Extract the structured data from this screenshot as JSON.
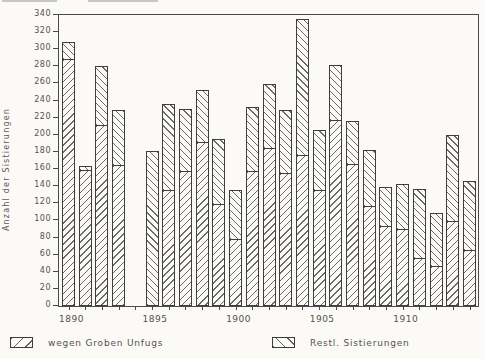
{
  "chart_data": {
    "type": "bar",
    "stacked": true,
    "title": "",
    "xlabel": "",
    "ylabel": "Anzahl der Sistierungen",
    "ylim": [
      0,
      340
    ],
    "ytick_step": 20,
    "grid": false,
    "legend_position": "bottom",
    "x_labeled_ticks": [
      1890,
      1895,
      1900,
      1905,
      1910
    ],
    "x_range": [
      1890,
      1914
    ],
    "missing_years": [
      1894
    ],
    "categories": [
      1890,
      1891,
      1892,
      1893,
      1895,
      1896,
      1897,
      1898,
      1899,
      1900,
      1901,
      1902,
      1903,
      1904,
      1905,
      1906,
      1907,
      1908,
      1909,
      1910,
      1911,
      1912,
      1913,
      1914
    ],
    "series": [
      {
        "name": "wegen Groben Unfugs",
        "hatch": "/",
        "values": [
          287,
          158,
          210,
          163,
          0,
          134,
          157,
          191,
          118,
          77,
          156,
          184,
          154,
          175,
          134,
          216,
          165,
          116,
          92,
          89,
          55,
          45,
          98,
          64
        ]
      },
      {
        "name": "Restl. Sistierungen",
        "hatch": "\\",
        "values": [
          20,
          5,
          69,
          64,
          180,
          101,
          73,
          61,
          76,
          57,
          75,
          75,
          74,
          159,
          70,
          64,
          50,
          65,
          45,
          52,
          81,
          62,
          101,
          81
        ]
      }
    ],
    "totals": [
      307,
      163,
      279,
      227,
      180,
      235,
      230,
      252,
      194,
      134,
      231,
      259,
      228,
      334,
      204,
      280,
      215,
      181,
      137,
      141,
      136,
      107,
      199,
      145
    ]
  },
  "legend": {
    "items": [
      {
        "label": "wegen Groben Unfugs",
        "hatch": "/"
      },
      {
        "label": "Restl. Sistierungen",
        "hatch": "\\"
      }
    ]
  }
}
